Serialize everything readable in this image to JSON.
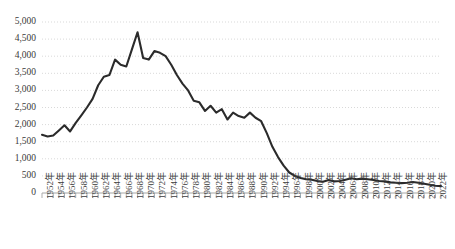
{
  "chart_data": {
    "type": "line",
    "title": "",
    "subtitle": "",
    "xlabel": "",
    "ylabel": "",
    "grid": true,
    "legend": false,
    "legend_position": "none",
    "line_color": "#2b2b2b",
    "grid_color": "#d9d9d9",
    "axis_color": "#a6a6a6",
    "background": "#ffffff",
    "ylim": [
      0,
      5000
    ],
    "ytick_values": [
      0,
      500,
      1000,
      1500,
      2000,
      2500,
      3000,
      3500,
      4000,
      4500,
      5000
    ],
    "ytick_labels": [
      "0",
      "500",
      "1,000",
      "1,500",
      "2,000",
      "2,500",
      "3,000",
      "3,500",
      "4,000",
      "4,500",
      "5,000"
    ],
    "xlim": [
      1952,
      2023
    ],
    "xtick_labels": [
      "1952年",
      "1954年",
      "1956年",
      "1958年",
      "1960年",
      "1962年",
      "1964年",
      "1966年",
      "1968年",
      "1970年",
      "1972年",
      "1974年",
      "1976年",
      "1978年",
      "1980年",
      "1982年",
      "1984年",
      "1986年",
      "1988年",
      "1990年",
      "1992年",
      "1994年",
      "1996年",
      "1998年",
      "2000年",
      "2002年",
      "2004年",
      "2006年",
      "2008年",
      "2010年",
      "2012年",
      "2014年",
      "2016年",
      "2018年",
      "2020年",
      "2022年"
    ],
    "x": [
      1952,
      1953,
      1954,
      1955,
      1956,
      1957,
      1958,
      1959,
      1960,
      1961,
      1962,
      1963,
      1964,
      1965,
      1966,
      1967,
      1968,
      1969,
      1970,
      1971,
      1972,
      1973,
      1974,
      1975,
      1976,
      1977,
      1978,
      1979,
      1980,
      1981,
      1982,
      1983,
      1984,
      1985,
      1986,
      1987,
      1988,
      1989,
      1990,
      1991,
      1992,
      1993,
      1994,
      1995,
      1996,
      1997,
      1998,
      1999,
      2000,
      2001,
      2002,
      2003,
      2004,
      2005,
      2006,
      2007,
      2008,
      2009,
      2010,
      2011,
      2012,
      2013,
      2014,
      2015,
      2016,
      2017,
      2018,
      2019,
      2020,
      2021,
      2022,
      2023
    ],
    "values": [
      1700,
      1650,
      1680,
      1830,
      1980,
      1800,
      2050,
      2270,
      2500,
      2750,
      3150,
      3400,
      3450,
      3900,
      3750,
      3700,
      4200,
      4700,
      3950,
      3900,
      4150,
      4100,
      4000,
      3750,
      3450,
      3200,
      3000,
      2700,
      2650,
      2400,
      2550,
      2350,
      2450,
      2150,
      2350,
      2250,
      2200,
      2350,
      2200,
      2100,
      1750,
      1350,
      1050,
      800,
      600,
      500,
      440,
      400,
      390,
      350,
      330,
      380,
      340,
      350,
      390,
      430,
      400,
      420,
      400,
      380,
      350,
      340,
      310,
      300,
      290,
      300,
      320,
      300,
      270,
      240,
      210,
      200
    ]
  }
}
